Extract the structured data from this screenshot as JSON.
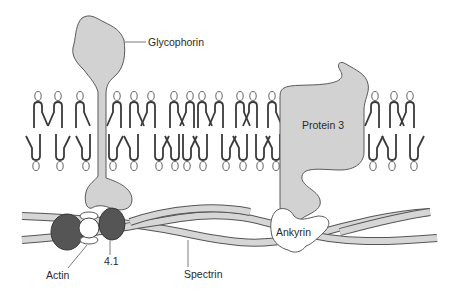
{
  "colors": {
    "protein_fill": "#d2d2d2",
    "outline": "#5a5a5a",
    "lipid_stroke": "#3a3a3a",
    "spectrin_fill": "#d6d6d6",
    "band41_fill": "#555555",
    "actin_fill": "#ffffff",
    "ankyrin_fill": "#ffffff",
    "label_text": "#2a2a2a"
  },
  "labels": {
    "glycophorin": "Glycophorin",
    "protein3": "Protein 3",
    "ankyrin": "Ankyrin",
    "actin": "Actin",
    "band41": "4.1",
    "spectrin": "Spectrin"
  },
  "bilayer": {
    "top_head_x": [
      38,
      58,
      80,
      117,
      134,
      151,
      174,
      190,
      202,
      219,
      240,
      253,
      272,
      375,
      394,
      410
    ],
    "bottom_head_x": [
      36,
      60,
      86,
      113,
      134,
      159,
      175,
      187,
      203,
      226,
      243,
      260,
      276,
      373,
      392,
      414
    ]
  }
}
